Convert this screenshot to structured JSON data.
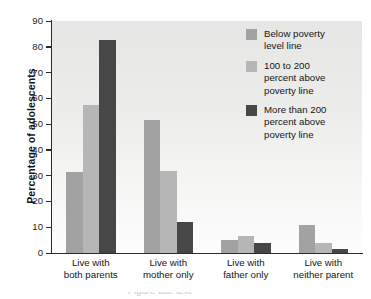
{
  "chart_data": {
    "type": "bar",
    "title": "",
    "xlabel": "",
    "ylabel": "Percentage of adolescents",
    "ylim": [
      0,
      90
    ],
    "yticks": [
      "0",
      "10",
      "20",
      "30",
      "40",
      "50",
      "60",
      "70",
      "80",
      "90"
    ],
    "grid": false,
    "legend_position": "top-right",
    "categories": [
      "Live with both parents",
      "Live with mother only",
      "Live with father only",
      "Live with neither parent"
    ],
    "category_lines": [
      [
        "Live with",
        "both parents"
      ],
      [
        "Live with",
        "mother only"
      ],
      [
        "Live with",
        "father only"
      ],
      [
        "Live with",
        "neither parent"
      ]
    ],
    "series": [
      {
        "name": "Below poverty level line",
        "legend_lines": [
          "Below poverty",
          "level line"
        ],
        "color": "#a2a2a2",
        "values": [
          31.5,
          51.5,
          5.0,
          11.0
        ]
      },
      {
        "name": "100 to 200 percent above poverty line",
        "legend_lines": [
          "100 to 200",
          "percent above",
          "poverty line"
        ],
        "color": "#b6b6b6",
        "values": [
          57.5,
          32.0,
          6.5,
          4.0
        ]
      },
      {
        "name": "More than 200 percent above poverty line",
        "legend_lines": [
          "More than 200",
          "percent above",
          "poverty line"
        ],
        "color": "#474747",
        "values": [
          82.5,
          12.0,
          4.0,
          1.5
        ]
      }
    ]
  },
  "axis": {
    "y_title": "Percentage of adolescents"
  },
  "footer": {
    "clipped_fragment": "Figure title text"
  }
}
